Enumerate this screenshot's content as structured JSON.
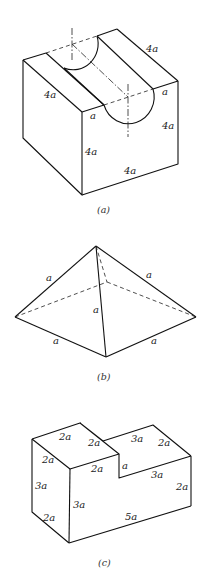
{
  "figures": [
    {
      "id": "a",
      "caption": "(a)",
      "description": "Cube of side 4a with a semicircular groove of radius a cut along the top face",
      "labels": {
        "top_back_edge": "4a",
        "left_top_edge": "4a",
        "groove_offset_front": "a",
        "groove_offset_right": "a",
        "front_vertical": "4a",
        "right_vertical": "4a",
        "front_bottom": "4a"
      }
    },
    {
      "id": "b",
      "caption": "(b)",
      "description": "Square pyramid with all edges of length a",
      "labels": {
        "left_slant": "a",
        "right_slant": "a",
        "front_slant": "a",
        "base_left": "a",
        "base_right": "a"
      }
    },
    {
      "id": "c",
      "caption": "(c)",
      "description": "L-shaped stepped block",
      "labels": {
        "top_back_left": "2a",
        "top_right_of_step_top": "2a",
        "top_depth_left": "2a",
        "top_front_step": "2a",
        "step_back": "3a",
        "right_top_depth": "2a",
        "step_height": "a",
        "step_front": "3a",
        "right_vertical": "2a",
        "left_vertical": "3a",
        "front_vertical": "3a",
        "bottom_left_depth": "2a",
        "bottom_front": "5a"
      }
    }
  ]
}
